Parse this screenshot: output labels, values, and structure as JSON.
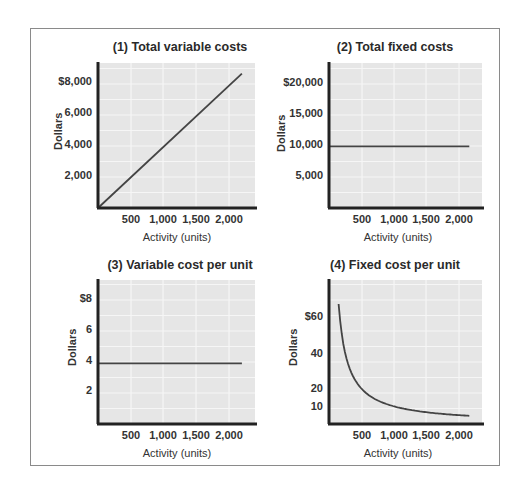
{
  "figure": {
    "axis_label_y": "Dollars",
    "axis_label_x": "Activity (units)"
  },
  "chart_data": [
    {
      "type": "line",
      "title": "(1)  Total variable costs",
      "xlabel": "Activity (units)",
      "ylabel": "Dollars",
      "x_ticks": [
        "500",
        "1,000",
        "1,500",
        "2,000"
      ],
      "y_ticks": [
        "2,000",
        "4,000",
        "6,000",
        "$8,000"
      ],
      "xlim": [
        0,
        2400
      ],
      "ylim": [
        0,
        9500
      ],
      "grid": true,
      "series": [
        {
          "name": "Total variable costs",
          "x": [
            0,
            2200
          ],
          "y": [
            0,
            8800
          ]
        }
      ]
    },
    {
      "type": "line",
      "title": "(2)  Total fixed costs",
      "xlabel": "Activity (units)",
      "ylabel": "Dollars",
      "x_ticks": [
        "500",
        "1,000",
        "1,500",
        "2,000"
      ],
      "y_ticks": [
        "5,000",
        "10,000",
        "15,000",
        "$20,000"
      ],
      "xlim": [
        0,
        2400
      ],
      "ylim": [
        0,
        23500
      ],
      "grid": true,
      "series": [
        {
          "name": "Total fixed costs",
          "x": [
            0,
            2200
          ],
          "y": [
            10000,
            10000
          ]
        }
      ]
    },
    {
      "type": "line",
      "title": "(3)  Variable cost per unit",
      "xlabel": "Activity (units)",
      "ylabel": "Dollars",
      "x_ticks": [
        "500",
        "1,000",
        "1,500",
        "2,000"
      ],
      "y_ticks": [
        "2",
        "4",
        "6",
        "$8"
      ],
      "xlim": [
        0,
        2400
      ],
      "ylim": [
        0,
        9.5
      ],
      "grid": true,
      "series": [
        {
          "name": "Variable cost per unit",
          "x": [
            0,
            2200
          ],
          "y": [
            4,
            4
          ]
        }
      ]
    },
    {
      "type": "line",
      "title": "(4)  Fixed cost per unit",
      "xlabel": "Activity (units)",
      "ylabel": "Dollars",
      "x_ticks": [
        "500",
        "1,000",
        "1,500",
        "2,000"
      ],
      "y_ticks": [
        "10",
        "20",
        "40",
        "$60"
      ],
      "xlim": [
        0,
        2400
      ],
      "ylim": [
        0,
        80
      ],
      "grid": true,
      "series": [
        {
          "name": "Fixed cost per unit",
          "x": [
            150,
            200,
            300,
            400,
            500,
            750,
            1000,
            1500,
            2000,
            2200
          ],
          "y": [
            66.7,
            50,
            33.3,
            25,
            20,
            13.3,
            10,
            6.7,
            5,
            4.5
          ]
        }
      ]
    }
  ]
}
